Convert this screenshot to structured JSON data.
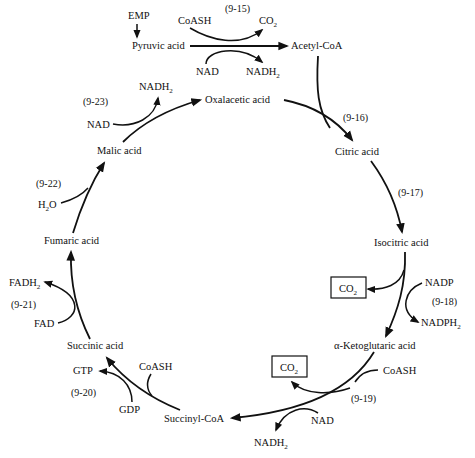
{
  "diagram": {
    "colors": {
      "ink": "#111111",
      "background": "#ffffff"
    },
    "nodes": {
      "emp": "EMP",
      "pyruvic": "Pyruvic acid",
      "acetyl_coa": "Acetyl-CoA",
      "oxalacetic": "Oxalacetic acid",
      "citric": "Citric acid",
      "isocitric": "Isocitric acid",
      "ketoglutaric": "α-Ketoglutaric acid",
      "succinyl_coa": "Succinyl-CoA",
      "succinic": "Succinic acid",
      "fumaric": "Fumaric acid",
      "malic": "Malic acid"
    },
    "reactions": {
      "r15": {
        "label": "(9-15)",
        "in1": "CoASH",
        "out1": "CO",
        "out1_sub": "2",
        "in2": "NAD",
        "out2": "NADH",
        "out2_sub": "2"
      },
      "r16": {
        "label": "(9-16)"
      },
      "r17": {
        "label": "(9-17)"
      },
      "r18": {
        "label": "(9-18)",
        "co2": "CO",
        "co2_sub": "2",
        "in": "NADP",
        "out": "NADPH",
        "out_sub": "2"
      },
      "r19": {
        "label": "(9-19)",
        "co2": "CO",
        "co2_sub": "2",
        "in1": "CoASH",
        "in2": "NAD",
        "out": "NADH",
        "out_sub": "2"
      },
      "r20": {
        "label": "(9-20)",
        "in1": "CoASH",
        "in2": "GDP",
        "out": "GTP"
      },
      "r21": {
        "label": "(9-21)",
        "in": "FAD",
        "out": "FADH",
        "out_sub": "2"
      },
      "r22": {
        "label": "(9-22)",
        "in": "H",
        "in_sub": "2",
        "in_tail": "O"
      },
      "r23": {
        "label": "(9-23)",
        "in": "NAD",
        "out": "NADH",
        "out_sub": "2"
      }
    }
  }
}
